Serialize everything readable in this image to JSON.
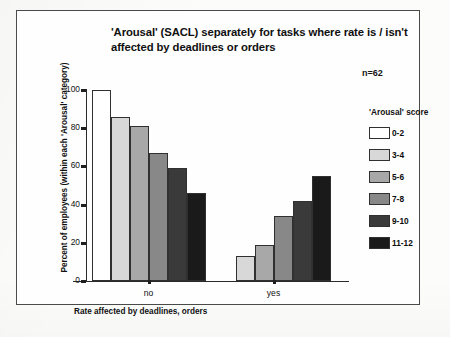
{
  "chart_data": {
    "type": "bar",
    "title": "'Arousal' (SACL) separately for tasks where rate is / isn't affected by deadlines or orders",
    "title_line1": "'Arousal' (SACL) separately for tasks where rate is / isn't",
    "title_line2": "affected by deadlines or orders",
    "annotation": "n=62",
    "xlabel": "Rate affected by deadlines, orders",
    "ylabel": "Percent of employees (within each 'Arousal' category)",
    "categories": [
      "no",
      "yes"
    ],
    "ylim": [
      0,
      100
    ],
    "yticks": [
      0,
      20,
      40,
      60,
      80,
      100
    ],
    "ytick_labels": [
      "0",
      "20",
      "40",
      "60",
      "80",
      "100"
    ],
    "grid": false,
    "legend_position": "right",
    "legend_title": "'Arousal'  score",
    "series": [
      {
        "name": "0-2",
        "values": [
          100,
          0
        ],
        "color": "#ffffff"
      },
      {
        "name": "3-4",
        "values": [
          86,
          13
        ],
        "color": "#d8d8d8"
      },
      {
        "name": "5-6",
        "values": [
          81,
          19
        ],
        "color": "#a8a8a8"
      },
      {
        "name": "7-8",
        "values": [
          67,
          34
        ],
        "color": "#888888"
      },
      {
        "name": "9-10",
        "values": [
          59,
          42
        ],
        "color": "#3a3a3a"
      },
      {
        "name": "11-12",
        "values": [
          46,
          55
        ],
        "color": "#1a1a1a"
      }
    ]
  }
}
